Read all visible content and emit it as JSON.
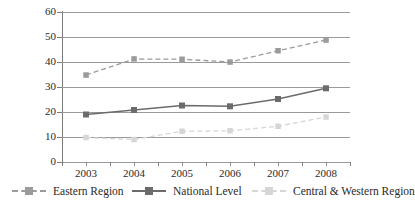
{
  "chart_data": {
    "type": "line",
    "title": "",
    "subtitle": "",
    "xlabel": "",
    "ylabel": "",
    "categories": [
      "2003",
      "2004",
      "2005",
      "2006",
      "2007",
      "2008"
    ],
    "x_tick_labels": [
      "2003",
      "2004",
      "2005",
      "2006",
      "2007",
      "2008"
    ],
    "y_tick_labels": [
      "0",
      "10",
      "20",
      "30",
      "40",
      "50",
      "60"
    ],
    "y_ticks": [
      0,
      10,
      20,
      30,
      40,
      50,
      60
    ],
    "ylim": [
      0,
      60
    ],
    "grid": "horizontal",
    "legend_position": "bottom",
    "series": [
      {
        "name": "Eastern Region",
        "values": [
          34.8,
          41.2,
          41.1,
          40.0,
          44.5,
          48.8
        ],
        "color": "#9b9b9b",
        "line_style": "dashed",
        "marker": "square"
      },
      {
        "name": "National Level",
        "values": [
          19.0,
          20.8,
          22.6,
          22.3,
          25.2,
          29.5
        ],
        "color": "#6b6b6b",
        "line_style": "solid",
        "marker": "square"
      },
      {
        "name": "Central & Western Region",
        "values": [
          9.8,
          9.0,
          12.3,
          12.5,
          14.3,
          18.0
        ],
        "color": "#d6d6d6",
        "line_style": "dashed",
        "marker": "square"
      }
    ]
  },
  "legend": {
    "entries": [
      {
        "label": "Eastern Region"
      },
      {
        "label": "National Level"
      },
      {
        "label": "Central & Western Region"
      }
    ]
  },
  "axes": {
    "y_labels": [
      "60",
      "50",
      "40",
      "30",
      "20",
      "10",
      "0"
    ],
    "x_labels": [
      "2003",
      "2004",
      "2005",
      "2006",
      "2007",
      "2008"
    ]
  },
  "colors": {
    "eastern": "#9b9b9b",
    "national": "#6b6b6b",
    "central_western": "#d6d6d6",
    "gridline": "#9a9a9a",
    "axis": "#7d7d7d",
    "text": "#2a2a2a",
    "background": "#ffffff"
  }
}
